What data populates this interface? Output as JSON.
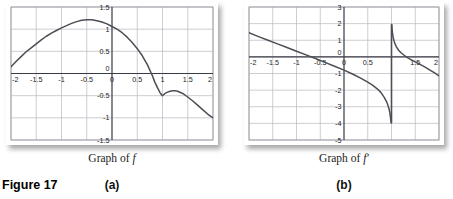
{
  "figure": {
    "number_label": "Figure 17",
    "panels": [
      {
        "id": "a",
        "sublabel": "(a)",
        "caption_prefix": "Graph of ",
        "caption_symbol": "f"
      },
      {
        "id": "b",
        "sublabel": "(b)",
        "caption_prefix": "Graph of ",
        "caption_symbol": "f′"
      }
    ]
  },
  "colors": {
    "curve": "#4d4d55",
    "grid": "#b8b8c0",
    "axis": "#3a3a44",
    "frame": "#9a9aa4",
    "text": "#1a1a1a",
    "background": "#ffffff"
  },
  "chart_data": [
    {
      "type": "line",
      "id": "graph-of-f",
      "title": "Graph of f",
      "xlabel": "",
      "ylabel": "",
      "xlim": [
        -2,
        2
      ],
      "ylim": [
        -1.5,
        1.5
      ],
      "grid": true,
      "legend": "none",
      "xticks": [
        -2,
        -1.5,
        -1,
        -0.5,
        0,
        0.5,
        1,
        1.5,
        2
      ],
      "xticklabels": [
        "-2",
        "-1.5",
        "-1",
        "-0.5",
        "0",
        "0.5",
        "1",
        "1.5",
        "2"
      ],
      "yticks": [
        1.5,
        1,
        0.5,
        0,
        -0.5,
        -1,
        -1.5
      ],
      "yticklabels": [
        "1.5",
        "1",
        "0.5",
        "0",
        "-0.5",
        "-1",
        "-1.5"
      ],
      "series": [
        {
          "name": "f",
          "x": [
            -2.0,
            -1.9,
            -1.8,
            -1.7,
            -1.6,
            -1.5,
            -1.4,
            -1.3,
            -1.2,
            -1.1,
            -1.0,
            -0.9,
            -0.8,
            -0.7,
            -0.6,
            -0.5,
            -0.4,
            -0.3,
            -0.2,
            -0.1,
            0.0,
            0.1,
            0.2,
            0.3,
            0.4,
            0.5,
            0.6,
            0.7,
            0.8,
            0.85,
            0.9,
            0.95,
            0.98,
            1.0,
            1.02,
            1.05,
            1.1,
            1.15,
            1.2,
            1.25,
            1.3,
            1.4,
            1.5,
            1.6,
            1.7,
            1.8,
            1.9,
            2.0
          ],
          "y": [
            0.15,
            0.27,
            0.38,
            0.49,
            0.58,
            0.67,
            0.76,
            0.84,
            0.91,
            0.97,
            1.03,
            1.08,
            1.13,
            1.17,
            1.2,
            1.21,
            1.21,
            1.19,
            1.16,
            1.12,
            1.06,
            1.0,
            0.92,
            0.82,
            0.7,
            0.56,
            0.4,
            0.2,
            -0.05,
            -0.2,
            -0.32,
            -0.43,
            -0.48,
            -0.5,
            -0.48,
            -0.45,
            -0.42,
            -0.4,
            -0.39,
            -0.39,
            -0.4,
            -0.45,
            -0.53,
            -0.62,
            -0.72,
            -0.82,
            -0.92,
            -1.0
          ]
        }
      ],
      "annotations": [
        {
          "text": "cusp / vertical tangent",
          "x": 1.0,
          "y": -0.5
        }
      ]
    },
    {
      "type": "line",
      "id": "graph-of-f-prime",
      "title": "Graph of f′",
      "xlabel": "",
      "ylabel": "",
      "xlim": [
        -2,
        2
      ],
      "ylim": [
        -5,
        3
      ],
      "grid": true,
      "legend": "none",
      "xticks": [
        -2,
        -1.5,
        -1,
        -0.5,
        0,
        0.5,
        1,
        1.5,
        2
      ],
      "xticklabels": [
        "-2",
        "-1.5",
        "-1",
        "-0.5",
        "0",
        "0.5",
        "",
        "1.5",
        "2"
      ],
      "yticks": [
        3,
        2,
        1,
        0,
        -1,
        -2,
        -3,
        -4,
        -5
      ],
      "yticklabels": [
        "3",
        "2",
        "1",
        "0",
        "-1",
        "-2",
        "-3",
        "-4",
        "-5"
      ],
      "asymptote_x": 1.0,
      "series": [
        {
          "name": "f-prime-left",
          "x": [
            -2.0,
            -1.8,
            -1.6,
            -1.4,
            -1.2,
            -1.0,
            -0.8,
            -0.6,
            -0.4,
            -0.2,
            0.0,
            0.2,
            0.35,
            0.5,
            0.6,
            0.7,
            0.78,
            0.85,
            0.9,
            0.93,
            0.95,
            0.965,
            0.975,
            0.982,
            0.988,
            0.992,
            0.995
          ],
          "y": [
            1.45,
            1.22,
            1.0,
            0.78,
            0.56,
            0.34,
            0.12,
            -0.1,
            -0.33,
            -0.56,
            -0.8,
            -1.06,
            -1.28,
            -1.52,
            -1.7,
            -1.92,
            -2.15,
            -2.45,
            -2.72,
            -2.95,
            -3.15,
            -3.35,
            -3.55,
            -3.72,
            -3.85,
            -3.92,
            -3.98
          ]
        },
        {
          "name": "f-prime-right",
          "x": [
            1.005,
            1.01,
            1.015,
            1.02,
            1.03,
            1.04,
            1.06,
            1.08,
            1.1,
            1.15,
            1.2,
            1.3,
            1.4,
            1.5,
            1.6,
            1.7,
            1.8,
            1.9,
            2.0
          ],
          "y": [
            1.95,
            1.75,
            1.58,
            1.45,
            1.25,
            1.1,
            0.9,
            0.75,
            0.62,
            0.4,
            0.25,
            0.02,
            -0.15,
            -0.3,
            -0.45,
            -0.6,
            -0.78,
            -0.95,
            -1.15
          ]
        }
      ],
      "annotations": [
        {
          "text": "vertical asymptote",
          "x": 1.0,
          "y": 0
        }
      ]
    }
  ]
}
